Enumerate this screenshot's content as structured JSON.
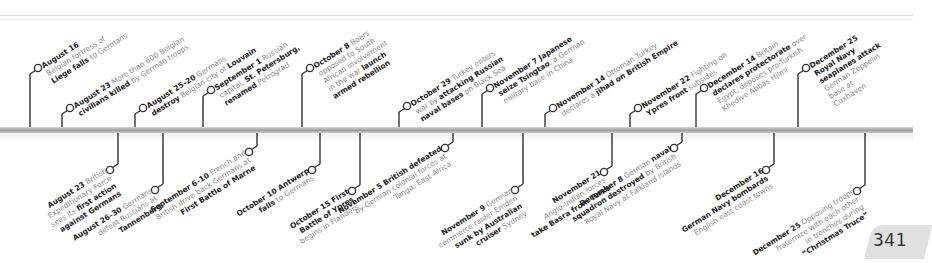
{
  "page": {
    "page_number": "341"
  },
  "colors": {
    "date_text": "#222222",
    "body_text": "#8a8a8a",
    "stem": "#333333",
    "axis": "#a9a9a9",
    "page_tab": "#e0e0e0"
  },
  "timeline": {
    "above": [
      {
        "axis_x": 30,
        "circle_x": 38,
        "circle_y": 68,
        "label_x": 43,
        "label_y": 64,
        "lines": [
          {
            "date": "August 16",
            "parts": []
          },
          {
            "parts": [
              {
                "t": "Belgian fortress of",
                "b": false
              }
            ]
          },
          {
            "parts": [
              {
                "t": "Liege falls",
                "b": true
              },
              {
                "t": " to Germans",
                "b": false
              }
            ]
          }
        ]
      },
      {
        "axis_x": 62,
        "circle_x": 70,
        "circle_y": 108,
        "label_x": 75,
        "label_y": 104,
        "lines": [
          {
            "date": "August 23",
            "parts": [
              {
                "t": " More than 600 Belgian",
                "b": false
              }
            ]
          },
          {
            "parts": [
              {
                "t": "civilians killed",
                "b": true
              },
              {
                "t": " by German troops",
                "b": false
              }
            ]
          }
        ]
      },
      {
        "axis_x": 135,
        "circle_x": 143,
        "circle_y": 108,
        "label_x": 148,
        "label_y": 104,
        "lines": [
          {
            "date": "August 25–20",
            "parts": [
              {
                "t": " Germans",
                "b": false
              }
            ]
          },
          {
            "parts": [
              {
                "t": "destroy",
                "b": true
              },
              {
                "t": " Belgian city of ",
                "b": false
              },
              {
                "t": "Louvain",
                "b": true
              }
            ]
          }
        ]
      },
      {
        "axis_x": 203,
        "circle_x": 211,
        "circle_y": 90,
        "label_x": 216,
        "label_y": 86,
        "lines": [
          {
            "date": "September 1",
            "parts": [
              {
                "t": " Russian",
                "b": false
              }
            ]
          },
          {
            "parts": [
              {
                "t": "capital, ",
                "b": false
              },
              {
                "t": "St. Petersburg,",
                "b": true
              }
            ]
          },
          {
            "parts": [
              {
                "t": "renamed",
                "b": true
              },
              {
                "t": " Petrograd",
                "b": false
              }
            ]
          }
        ]
      },
      {
        "axis_x": 302,
        "circle_x": 310,
        "circle_y": 68,
        "label_x": 315,
        "label_y": 64,
        "lines": [
          {
            "date": "October 8",
            "parts": [
              {
                "t": " Boers",
                "b": false
              }
            ]
          },
          {
            "parts": [
              {
                "t": "opposed to South",
                "b": false
              }
            ]
          },
          {
            "parts": [
              {
                "t": "African involvement",
                "b": false
              }
            ]
          },
          {
            "parts": [
              {
                "t": "in the war ",
                "b": false
              },
              {
                "t": "launch",
                "b": true
              }
            ]
          },
          {
            "parts": [
              {
                "t": "armed rebellion",
                "b": true
              }
            ]
          }
        ]
      },
      {
        "axis_x": 399,
        "circle_x": 407,
        "circle_y": 106,
        "label_x": 412,
        "label_y": 102,
        "lines": [
          {
            "date": "October 29",
            "parts": [
              {
                "t": " Turkey enters",
                "b": false
              }
            ]
          },
          {
            "parts": [
              {
                "t": "war by ",
                "b": false
              },
              {
                "t": "attacking Russian",
                "b": true
              }
            ]
          },
          {
            "parts": [
              {
                "t": "naval bases",
                "b": true
              },
              {
                "t": " on Black Sea",
                "b": false
              }
            ]
          }
        ]
      },
      {
        "axis_x": 482,
        "circle_x": 490,
        "circle_y": 88,
        "label_x": 495,
        "label_y": 84,
        "lines": [
          {
            "date": "November 7",
            "parts": [
              {
                "t": " Japanese",
                "b": true
              }
            ]
          },
          {
            "parts": [
              {
                "t": "seize Tsingtao",
                "b": true
              },
              {
                "t": ", a German",
                "b": false
              }
            ]
          },
          {
            "parts": [
              {
                "t": "military base in China",
                "b": false
              }
            ]
          }
        ]
      },
      {
        "axis_x": 545,
        "circle_x": 553,
        "circle_y": 108,
        "label_x": 558,
        "label_y": 104,
        "lines": [
          {
            "date": "November 14",
            "parts": [
              {
                "t": " Ottoman Turkey",
                "b": false
              }
            ]
          },
          {
            "parts": [
              {
                "t": "declares a ",
                "b": false
              },
              {
                "t": "jihad on British Empire",
                "b": true
              }
            ]
          }
        ]
      },
      {
        "axis_x": 630,
        "circle_x": 638,
        "circle_y": 108,
        "label_x": 643,
        "label_y": 104,
        "lines": [
          {
            "date": "November 22",
            "parts": [
              {
                "t": " Fighting on",
                "b": false
              }
            ]
          },
          {
            "parts": [
              {
                "t": "Ypres front",
                "b": true
              },
              {
                "t": " subsides",
                "b": false
              }
            ]
          }
        ]
      },
      {
        "axis_x": 696,
        "circle_x": 704,
        "circle_y": 88,
        "label_x": 709,
        "label_y": 84,
        "lines": [
          {
            "date": "December 14",
            "parts": [
              {
                "t": " Britain",
                "b": false
              }
            ]
          },
          {
            "parts": [
              {
                "t": "declares protectorate",
                "b": true
              },
              {
                "t": " over",
                "b": false
              }
            ]
          },
          {
            "parts": [
              {
                "t": "Egypt, deposes pro-Turkish",
                "b": false
              }
            ]
          },
          {
            "parts": [
              {
                "t": "Khedive Abbas Hilmi",
                "b": false
              }
            ]
          }
        ]
      },
      {
        "axis_x": 798,
        "circle_x": 806,
        "circle_y": 68,
        "label_x": 811,
        "label_y": 64,
        "lines": [
          {
            "date": "December 25",
            "parts": []
          },
          {
            "parts": [
              {
                "t": "Royal Navy",
                "b": true
              }
            ]
          },
          {
            "parts": [
              {
                "t": "seaplanes attack",
                "b": true
              }
            ]
          },
          {
            "parts": [
              {
                "t": "German Zeppelin",
                "b": false
              }
            ]
          },
          {
            "parts": [
              {
                "t": "base at",
                "b": false
              }
            ]
          },
          {
            "parts": [
              {
                "t": "Cuxhaven",
                "b": false
              }
            ]
          }
        ]
      }
    ],
    "below": [
      {
        "axis_x": 118,
        "circle_x": 110,
        "circle_y": 170,
        "lines": [
          {
            "date": "August 23",
            "parts": [
              {
                "t": " British",
                "b": false
              }
            ]
          },
          {
            "parts": [
              {
                "t": "Expeditionary Force",
                "b": false
              }
            ]
          },
          {
            "parts": [
              {
                "t": "sees its ",
                "b": false
              },
              {
                "t": "first action",
                "b": true
              }
            ]
          },
          {
            "parts": [
              {
                "t": "against Germans",
                "b": true
              }
            ]
          }
        ]
      },
      {
        "axis_x": 163,
        "circle_x": 155,
        "circle_y": 190,
        "lines": [
          {
            "date": "August 26–30",
            "parts": [
              {
                "t": " Germans",
                "b": false
              }
            ]
          },
          {
            "parts": [
              {
                "t": "defeat Russians at",
                "b": false
              }
            ]
          },
          {
            "parts": [
              {
                "t": "Tannenberg",
                "b": true
              }
            ]
          }
        ]
      },
      {
        "axis_x": 257,
        "circle_x": 249,
        "circle_y": 152,
        "lines": [
          {
            "date": "September 6–10",
            "parts": [
              {
                "t": " French and",
                "b": false
              }
            ]
          },
          {
            "parts": [
              {
                "t": "British drive back Germans at",
                "b": false
              }
            ]
          },
          {
            "parts": [
              {
                "t": "First Battle of Marne",
                "b": true
              }
            ]
          }
        ]
      },
      {
        "axis_x": 320,
        "circle_x": 312,
        "circle_y": 170,
        "lines": [
          {
            "date": "October 10",
            "parts": [
              {
                "t": " Antwerp",
                "b": true
              }
            ]
          },
          {
            "parts": [
              {
                "t": "falls",
                "b": true
              },
              {
                "t": " to Germans",
                "b": false
              }
            ]
          }
        ]
      },
      {
        "axis_x": 360,
        "circle_x": 352,
        "circle_y": 191,
        "lines": [
          {
            "date": "October 15",
            "parts": [
              {
                "t": " First",
                "b": true
              }
            ]
          },
          {
            "parts": [
              {
                "t": "Battle of Ypres",
                "b": true
              }
            ]
          },
          {
            "parts": [
              {
                "t": "begins in Flanders",
                "b": false
              }
            ]
          }
        ]
      },
      {
        "axis_x": 453,
        "circle_x": 445,
        "circle_y": 148,
        "lines": [
          {
            "date": "November 5",
            "parts": [
              {
                "t": " British defeated",
                "b": true
              }
            ]
          },
          {
            "parts": [
              {
                "t": "by German colonial forces at",
                "b": false
              }
            ]
          },
          {
            "parts": [
              {
                "t": "Tanga, East Africa",
                "b": false
              }
            ]
          }
        ]
      },
      {
        "axis_x": 523,
        "circle_x": 515,
        "circle_y": 190,
        "lines": [
          {
            "date": "November 9",
            "parts": [
              {
                "t": " German",
                "b": false
              }
            ]
          },
          {
            "parts": [
              {
                "t": "commerce raider Emden",
                "b": false
              }
            ]
          },
          {
            "parts": [
              {
                "t": "sunk by Australian",
                "b": true
              }
            ]
          },
          {
            "parts": [
              {
                "t": "cruiser",
                "b": true
              },
              {
                "t": " Sydney",
                "b": false
              }
            ]
          }
        ]
      },
      {
        "axis_x": 612,
        "circle_x": 604,
        "circle_y": 172,
        "lines": [
          {
            "date": "November 21",
            "parts": []
          },
          {
            "parts": [
              {
                "t": "Anglo-Indian forces",
                "b": false
              }
            ]
          },
          {
            "parts": [
              {
                "t": "take Basra from Turks",
                "b": true
              }
            ]
          }
        ]
      },
      {
        "axis_x": 682,
        "circle_x": 674,
        "circle_y": 148,
        "lines": [
          {
            "date": "December 8",
            "parts": [
              {
                "t": " German ",
                "b": false
              },
              {
                "t": "naval",
                "b": true
              }
            ]
          },
          {
            "parts": [
              {
                "t": "squadron destroyed",
                "b": true
              },
              {
                "t": " by British",
                "b": false
              }
            ]
          },
          {
            "parts": [
              {
                "t": "Royal Navy at Falkland Islands",
                "b": false
              }
            ]
          }
        ]
      },
      {
        "axis_x": 774,
        "circle_x": 766,
        "circle_y": 170,
        "lines": [
          {
            "date": "December 16",
            "parts": []
          },
          {
            "parts": [
              {
                "t": "German Navy bombards",
                "b": true
              }
            ]
          },
          {
            "parts": [
              {
                "t": "English east coast towns",
                "b": false
              }
            ]
          }
        ]
      },
      {
        "axis_x": 865,
        "circle_x": 857,
        "circle_y": 191,
        "lines": [
          {
            "date": "December 25",
            "parts": [
              {
                "t": " Opposing troops",
                "b": false
              }
            ]
          },
          {
            "parts": [
              {
                "t": "fraternize with each other",
                "b": false
              }
            ]
          },
          {
            "parts": [
              {
                "t": "in trenches during",
                "b": false
              }
            ]
          },
          {
            "parts": [
              {
                "t": "“Christmas Truce”",
                "b": true
              }
            ]
          }
        ]
      }
    ]
  }
}
